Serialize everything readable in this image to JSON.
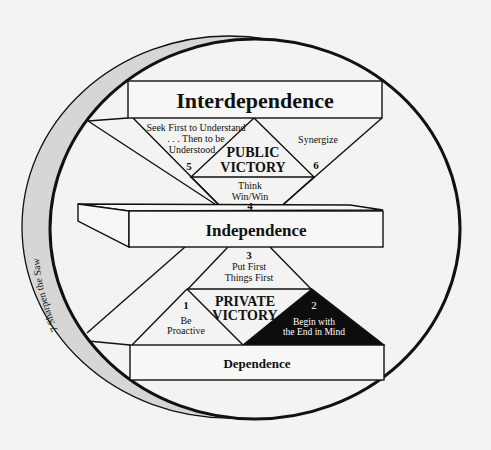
{
  "diagram": {
    "levels": {
      "interdependence": "Interdependence",
      "independence": "Independence",
      "dependence": "Dependence"
    },
    "victories": {
      "public": [
        "PUBLIC",
        "VICTORY"
      ],
      "private": [
        "PRIVATE",
        "VICTORY"
      ]
    },
    "habits": [
      {
        "number": "1",
        "lines": [
          "Be",
          "Proactive"
        ]
      },
      {
        "number": "2",
        "lines": [
          "Begin with",
          "the End in Mind"
        ]
      },
      {
        "number": "3",
        "lines": [
          "Put First",
          "Things First"
        ]
      },
      {
        "number": "4",
        "lines": [
          "Think",
          "Win/Win"
        ]
      },
      {
        "number": "5",
        "lines": [
          "Seek First to Understand",
          ". . . Then to be",
          "Understood"
        ]
      },
      {
        "number": "6",
        "lines": [
          "Synergize"
        ]
      },
      {
        "number": "7",
        "label": "Sharpen the Saw"
      }
    ],
    "colors": {
      "background": "#f3f3f1",
      "line": "#111111",
      "band": "#d6d6d4",
      "highlight_triangle": "#0d0d0d",
      "highlight_text": "#ffffff"
    }
  }
}
